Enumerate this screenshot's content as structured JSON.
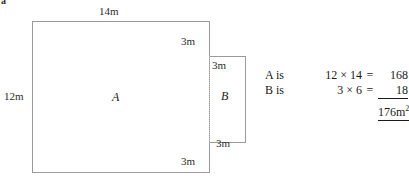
{
  "question_marker": "a",
  "diagram": {
    "shape_a": {
      "name": "A",
      "label": "A",
      "top_dimension": "14m",
      "left_dimension": "12m",
      "notch_vertical_top": "3m",
      "notch_vertical_bottom": "3m"
    },
    "shape_b": {
      "name": "B",
      "label": "B",
      "top_dimension": "3m",
      "bottom_dimension": "3m"
    }
  },
  "calculation": {
    "rows": [
      {
        "label": "A is",
        "expression": "12 × 14",
        "equals": "=",
        "value": "168"
      },
      {
        "label": "B is",
        "expression": "3 × 6",
        "equals": "=",
        "value": "18"
      }
    ],
    "total": "176m",
    "total_exponent": "2"
  },
  "colors": {
    "stroke": "#9a9a9a",
    "dotted_stroke": "#bdbdbd",
    "text": "#1a1a1a",
    "background": "#ffffff"
  }
}
